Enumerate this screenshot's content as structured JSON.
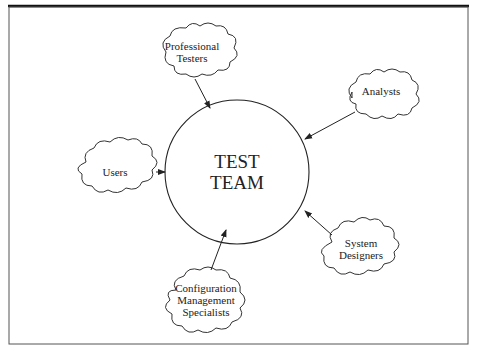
{
  "diagram": {
    "center": {
      "line1": "TEST",
      "line2": "TEAM"
    },
    "nodes": [
      {
        "id": "professional-testers",
        "line1": "Professional",
        "line2": "Testers"
      },
      {
        "id": "analysts",
        "line1": "Analysts"
      },
      {
        "id": "users",
        "line1": "Users"
      },
      {
        "id": "system-designers",
        "line1": "System",
        "line2": "Designers"
      },
      {
        "id": "configuration-management-specialists",
        "line1": "Configuration",
        "line2": "Management",
        "line3": "Specialists"
      }
    ],
    "edges": [
      {
        "from": "professional-testers",
        "to": "test-team"
      },
      {
        "from": "analysts",
        "to": "test-team"
      },
      {
        "from": "users",
        "to": "test-team"
      },
      {
        "from": "system-designers",
        "to": "test-team"
      },
      {
        "from": "configuration-management-specialists",
        "to": "test-team"
      }
    ]
  }
}
